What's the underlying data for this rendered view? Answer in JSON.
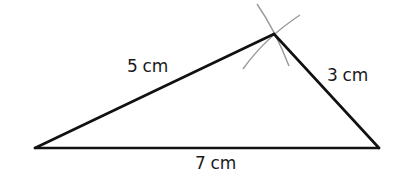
{
  "diagram": {
    "type": "triangle-construction",
    "vertices": {
      "left": [
        35,
        148
      ],
      "right": [
        379,
        148
      ],
      "apex": [
        274,
        34
      ]
    },
    "sides": [
      {
        "id": "left-side",
        "label": "5 cm"
      },
      {
        "id": "right-side",
        "label": "3 cm"
      },
      {
        "id": "base",
        "label": "7 cm"
      }
    ],
    "colors": {
      "line": "#111111",
      "arc": "#9a9a9a",
      "text": "#1a1a1a"
    }
  }
}
